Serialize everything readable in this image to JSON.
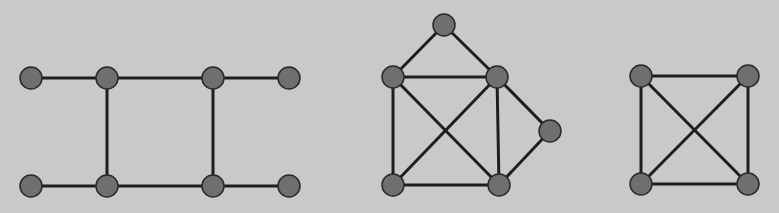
{
  "diagram": {
    "background": "#c9c9c9",
    "node_fill": "#6f6f6f",
    "node_stroke": "#2a2a2a",
    "edge_color": "#1e1e1e",
    "node_radius": 11,
    "edge_width": 3,
    "graphs": [
      {
        "name": "graph-ladder",
        "nodes": [
          {
            "id": "a",
            "x": 31,
            "y": 78
          },
          {
            "id": "b",
            "x": 107,
            "y": 78
          },
          {
            "id": "c",
            "x": 213,
            "y": 78
          },
          {
            "id": "d",
            "x": 289,
            "y": 78
          },
          {
            "id": "e",
            "x": 31,
            "y": 186
          },
          {
            "id": "f",
            "x": 107,
            "y": 186
          },
          {
            "id": "g",
            "x": 213,
            "y": 186
          },
          {
            "id": "h",
            "x": 289,
            "y": 186
          }
        ],
        "edges": [
          [
            "a",
            "b"
          ],
          [
            "b",
            "c"
          ],
          [
            "c",
            "d"
          ],
          [
            "e",
            "f"
          ],
          [
            "f",
            "g"
          ],
          [
            "g",
            "h"
          ],
          [
            "b",
            "f"
          ],
          [
            "c",
            "g"
          ]
        ]
      },
      {
        "name": "graph-house",
        "nodes": [
          {
            "id": "t",
            "x": 444,
            "y": 25
          },
          {
            "id": "l",
            "x": 393,
            "y": 77
          },
          {
            "id": "r",
            "x": 497,
            "y": 77
          },
          {
            "id": "s",
            "x": 550,
            "y": 131
          },
          {
            "id": "bl",
            "x": 393,
            "y": 185
          },
          {
            "id": "br",
            "x": 499,
            "y": 185
          }
        ],
        "edges": [
          [
            "t",
            "l"
          ],
          [
            "t",
            "r"
          ],
          [
            "l",
            "r"
          ],
          [
            "l",
            "bl"
          ],
          [
            "l",
            "br"
          ],
          [
            "r",
            "bl"
          ],
          [
            "r",
            "br"
          ],
          [
            "r",
            "s"
          ],
          [
            "s",
            "br"
          ],
          [
            "bl",
            "br"
          ]
        ]
      },
      {
        "name": "graph-k4",
        "nodes": [
          {
            "id": "p",
            "x": 641,
            "y": 76
          },
          {
            "id": "q",
            "x": 748,
            "y": 76
          },
          {
            "id": "u",
            "x": 641,
            "y": 184
          },
          {
            "id": "v",
            "x": 748,
            "y": 184
          }
        ],
        "edges": [
          [
            "p",
            "q"
          ],
          [
            "p",
            "u"
          ],
          [
            "q",
            "v"
          ],
          [
            "u",
            "v"
          ],
          [
            "p",
            "v"
          ],
          [
            "q",
            "u"
          ]
        ]
      }
    ]
  }
}
